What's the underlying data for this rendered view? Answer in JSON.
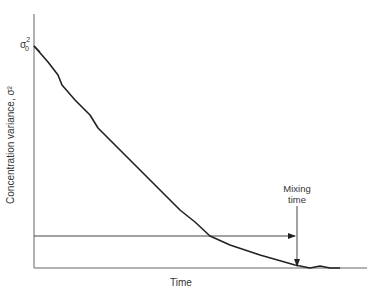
{
  "chart_data": {
    "type": "line",
    "title": "",
    "xlabel": "Time",
    "ylabel": "Concentration variance, σ²",
    "y_start_label": "σ₀²",
    "annotation": "Mixing time",
    "grid": false,
    "legend": "none",
    "x_ticks": [],
    "y_ticks": [],
    "series": [
      {
        "name": "Concentration variance decay",
        "points_px": [
          [
            34,
            46
          ],
          [
            48,
            62
          ],
          [
            58,
            75
          ],
          [
            62,
            85
          ],
          [
            75,
            100
          ],
          [
            90,
            115
          ],
          [
            98,
            128
          ],
          [
            105,
            135
          ],
          [
            120,
            150
          ],
          [
            140,
            170
          ],
          [
            160,
            190
          ],
          [
            180,
            210
          ],
          [
            195,
            222
          ],
          [
            210,
            236
          ],
          [
            230,
            245
          ],
          [
            260,
            255
          ],
          [
            295,
            265
          ],
          [
            300,
            266
          ],
          [
            310,
            268
          ],
          [
            320,
            266
          ],
          [
            330,
            268
          ],
          [
            340,
            268
          ]
        ],
        "x_norm": [
          0.0,
          0.04,
          0.07,
          0.08,
          0.12,
          0.17,
          0.19,
          0.21,
          0.26,
          0.32,
          0.38,
          0.44,
          0.48,
          0.53,
          0.59,
          0.68,
          0.79,
          0.8,
          0.83,
          0.86,
          0.89,
          0.92
        ],
        "y_norm": [
          1.0,
          0.93,
          0.87,
          0.82,
          0.76,
          0.69,
          0.63,
          0.6,
          0.53,
          0.44,
          0.35,
          0.26,
          0.21,
          0.14,
          0.1,
          0.06,
          0.01,
          0.01,
          0.0,
          0.01,
          0.0,
          0.0
        ]
      }
    ],
    "mixing_time_x_norm": 0.79,
    "mixing_threshold_y_norm": 0.14
  },
  "labels": {
    "xlabel": "Time",
    "ylabel": "Concentration variance, σ²",
    "sigma": "σ",
    "sigma_sub": "0",
    "sigma_sup": "2",
    "mixing_line1": "Mixing",
    "mixing_line2": "time"
  }
}
